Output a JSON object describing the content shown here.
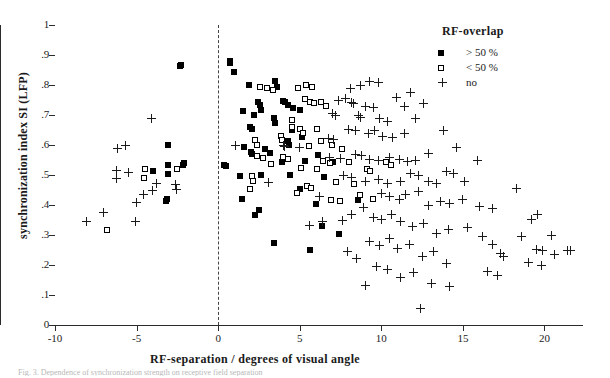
{
  "figure": {
    "caption_partial": "Fig. 3. Dependence of synchronization strength on receptive field separation"
  },
  "legend": {
    "title": "RF-overlap",
    "entries": [
      {
        "key": "filled-square",
        "label": "> 50 %"
      },
      {
        "key": "open-square",
        "label": "< 50 %"
      },
      {
        "key": "plus",
        "label": "no"
      }
    ]
  },
  "chart_data": {
    "type": "scatter",
    "title": "",
    "xlabel": "RF-separation / degrees of visual angle",
    "ylabel": "synchronization index SI (LFP)",
    "xlim": [
      -10,
      22.3
    ],
    "ylim": [
      0,
      1
    ],
    "xticks": [
      -10,
      -5,
      0,
      5,
      10,
      15,
      20
    ],
    "xticklabels": [
      "-10",
      "-5",
      "0",
      "5",
      "10",
      "15",
      "20"
    ],
    "yticks": [
      0,
      0.1,
      0.2,
      0.3,
      0.4,
      0.5,
      0.6,
      0.7,
      0.8,
      0.9,
      1
    ],
    "yticklabels": [
      "0",
      ".1",
      ".2",
      ".3",
      ".4",
      ".5",
      ".6",
      ".7",
      ".8",
      ".9",
      "1"
    ],
    "grid": false,
    "legend_position": "top-right",
    "reference_lines": [
      {
        "orientation": "vertical",
        "value": 0,
        "style": "dashed"
      }
    ],
    "series": [
      {
        "name": "> 50 %",
        "marker": "filled-square",
        "points": [
          [
            -2.3,
            0.868
          ],
          [
            -2.35,
            0.862
          ],
          [
            -3.1,
            0.6
          ],
          [
            -3.1,
            0.535
          ],
          [
            -3.1,
            0.505
          ],
          [
            -2.1,
            0.54
          ],
          [
            -4.0,
            0.515
          ],
          [
            -3.15,
            0.42
          ],
          [
            -3.2,
            0.412
          ],
          [
            -2.15,
            0.535
          ],
          [
            0.35,
            0.535
          ],
          [
            0.45,
            0.53
          ],
          [
            0.7,
            0.88
          ],
          [
            0.75,
            0.872
          ],
          [
            0.95,
            0.845
          ],
          [
            1.9,
            0.8
          ],
          [
            3.5,
            0.812
          ],
          [
            3.6,
            0.795
          ],
          [
            1.5,
            0.712
          ],
          [
            2.2,
            0.7
          ],
          [
            2.6,
            0.718
          ],
          [
            1.95,
            0.66
          ],
          [
            2.05,
            0.655
          ],
          [
            4.0,
            0.748
          ],
          [
            4.1,
            0.742
          ],
          [
            4.3,
            0.735
          ],
          [
            4.6,
            0.722
          ],
          [
            5.0,
            0.718
          ],
          [
            3.45,
            0.69
          ],
          [
            3.5,
            0.672
          ],
          [
            1.6,
            0.595
          ],
          [
            2.0,
            0.578
          ],
          [
            2.05,
            0.57
          ],
          [
            2.9,
            0.588
          ],
          [
            3.2,
            0.575
          ],
          [
            4.3,
            0.612
          ],
          [
            4.35,
            0.6
          ],
          [
            1.35,
            0.498
          ],
          [
            2.6,
            0.5
          ],
          [
            1.45,
            0.42
          ],
          [
            2.25,
            0.368
          ],
          [
            2.5,
            0.382
          ],
          [
            3.4,
            0.275
          ],
          [
            5.3,
            0.548
          ],
          [
            6.5,
            0.492
          ],
          [
            4.55,
            0.65
          ],
          [
            5.15,
            0.628
          ],
          [
            6.0,
            0.405
          ],
          [
            6.35,
            0.33
          ],
          [
            5.0,
            0.452
          ],
          [
            5.6,
            0.25
          ],
          [
            7.4,
            0.305
          ],
          [
            8.6,
            0.418
          ],
          [
            7.05,
            0.545
          ],
          [
            6.1,
            0.568
          ],
          [
            3.9,
            0.545
          ],
          [
            4.4,
            0.5
          ],
          [
            2.45,
            0.742
          ],
          [
            2.55,
            0.735
          ]
        ]
      },
      {
        "name": "< 50 %",
        "marker": "open-square",
        "points": [
          [
            -6.8,
            0.318
          ],
          [
            -4.5,
            0.52
          ],
          [
            -4.55,
            0.49
          ],
          [
            -2.55,
            0.52
          ],
          [
            2.55,
            0.795
          ],
          [
            3.0,
            0.79
          ],
          [
            3.35,
            0.785
          ],
          [
            4.9,
            0.79
          ],
          [
            5.4,
            0.8
          ],
          [
            5.75,
            0.795
          ],
          [
            5.3,
            0.752
          ],
          [
            5.6,
            0.745
          ],
          [
            5.9,
            0.74
          ],
          [
            6.3,
            0.742
          ],
          [
            6.6,
            0.73
          ],
          [
            4.5,
            0.682
          ],
          [
            4.55,
            0.66
          ],
          [
            3.85,
            0.63
          ],
          [
            3.9,
            0.618
          ],
          [
            5.0,
            0.655
          ],
          [
            5.2,
            0.64
          ],
          [
            6.05,
            0.655
          ],
          [
            3.95,
            0.56
          ],
          [
            4.25,
            0.555
          ],
          [
            5.55,
            0.598
          ],
          [
            6.3,
            0.612
          ],
          [
            7.0,
            0.6
          ],
          [
            7.6,
            0.588
          ],
          [
            5.05,
            0.522
          ],
          [
            6.05,
            0.52
          ],
          [
            6.4,
            0.548
          ],
          [
            6.85,
            0.54
          ],
          [
            2.25,
            0.618
          ],
          [
            2.35,
            0.6
          ],
          [
            2.4,
            0.565
          ],
          [
            2.75,
            0.558
          ],
          [
            3.25,
            0.538
          ],
          [
            7.2,
            0.478
          ],
          [
            8.35,
            0.47
          ],
          [
            9.1,
            0.52
          ],
          [
            9.3,
            0.512
          ],
          [
            8.0,
            0.545
          ],
          [
            5.45,
            0.465
          ],
          [
            5.7,
            0.458
          ],
          [
            4.85,
            0.44
          ],
          [
            10.3,
            0.545
          ],
          [
            10.6,
            0.535
          ],
          [
            2.05,
            0.498
          ],
          [
            2.15,
            0.48
          ],
          [
            1.95,
            0.452
          ],
          [
            8.7,
            0.435
          ],
          [
            9.5,
            0.42
          ],
          [
            6.9,
            0.418
          ],
          [
            7.45,
            0.412
          ]
        ]
      },
      {
        "name": "no",
        "marker": "plus",
        "points": [
          [
            -8.1,
            0.345
          ],
          [
            -7.0,
            0.375
          ],
          [
            -6.2,
            0.59
          ],
          [
            -5.7,
            0.598
          ],
          [
            -6.25,
            0.515
          ],
          [
            -6.25,
            0.49
          ],
          [
            -5.5,
            0.51
          ],
          [
            -5.0,
            0.408
          ],
          [
            -5.05,
            0.345
          ],
          [
            -4.55,
            0.435
          ],
          [
            -4.1,
            0.69
          ],
          [
            -4.0,
            0.45
          ],
          [
            -3.8,
            0.472
          ],
          [
            4.0,
            0.6
          ],
          [
            4.05,
            0.595
          ],
          [
            5.0,
            0.592
          ],
          [
            6.75,
            0.622
          ],
          [
            7.05,
            0.618
          ],
          [
            7.4,
            0.748
          ],
          [
            7.8,
            0.755
          ],
          [
            8.1,
            0.79
          ],
          [
            8.7,
            0.8
          ],
          [
            9.3,
            0.812
          ],
          [
            9.8,
            0.81
          ],
          [
            8.15,
            0.742
          ],
          [
            8.3,
            0.738
          ],
          [
            9.05,
            0.73
          ],
          [
            9.5,
            0.725
          ],
          [
            8.6,
            0.7
          ],
          [
            8.75,
            0.692
          ],
          [
            7.0,
            0.705
          ],
          [
            7.2,
            0.698
          ],
          [
            9.9,
            0.688
          ],
          [
            10.4,
            0.68
          ],
          [
            8.0,
            0.652
          ],
          [
            8.4,
            0.648
          ],
          [
            9.2,
            0.64
          ],
          [
            9.6,
            0.648
          ],
          [
            10.1,
            0.63
          ],
          [
            10.7,
            0.625
          ],
          [
            11.4,
            0.64
          ],
          [
            6.8,
            0.56
          ],
          [
            7.5,
            0.555
          ],
          [
            8.4,
            0.57
          ],
          [
            8.8,
            0.565
          ],
          [
            9.25,
            0.552
          ],
          [
            9.8,
            0.548
          ],
          [
            10.5,
            0.56
          ],
          [
            11.1,
            0.552
          ],
          [
            11.6,
            0.545
          ],
          [
            12.1,
            0.548
          ],
          [
            7.7,
            0.498
          ],
          [
            8.2,
            0.492
          ],
          [
            9.0,
            0.478
          ],
          [
            9.8,
            0.485
          ],
          [
            10.4,
            0.472
          ],
          [
            11.2,
            0.48
          ],
          [
            11.8,
            0.505
          ],
          [
            12.3,
            0.498
          ],
          [
            12.9,
            0.48
          ],
          [
            13.4,
            0.472
          ],
          [
            14.0,
            0.512
          ],
          [
            14.4,
            0.505
          ],
          [
            15.1,
            0.48
          ],
          [
            10.0,
            0.44
          ],
          [
            10.5,
            0.428
          ],
          [
            11.1,
            0.42
          ],
          [
            11.5,
            0.435
          ],
          [
            12.3,
            0.445
          ],
          [
            12.9,
            0.4
          ],
          [
            13.6,
            0.412
          ],
          [
            14.2,
            0.405
          ],
          [
            15.0,
            0.418
          ],
          [
            9.5,
            0.36
          ],
          [
            10.0,
            0.352
          ],
          [
            10.6,
            0.37
          ],
          [
            11.2,
            0.345
          ],
          [
            11.9,
            0.33
          ],
          [
            12.6,
            0.34
          ],
          [
            13.4,
            0.305
          ],
          [
            14.1,
            0.318
          ],
          [
            15.3,
            0.325
          ],
          [
            9.3,
            0.28
          ],
          [
            9.9,
            0.265
          ],
          [
            10.5,
            0.29
          ],
          [
            11.0,
            0.255
          ],
          [
            11.7,
            0.268
          ],
          [
            12.5,
            0.23
          ],
          [
            13.2,
            0.245
          ],
          [
            14.0,
            0.205
          ],
          [
            9.7,
            0.195
          ],
          [
            10.4,
            0.185
          ],
          [
            11.2,
            0.16
          ],
          [
            12.0,
            0.175
          ],
          [
            13.1,
            0.14
          ],
          [
            14.2,
            0.13
          ],
          [
            12.4,
            0.055
          ],
          [
            16.2,
            0.295
          ],
          [
            16.8,
            0.268
          ],
          [
            17.3,
            0.24
          ],
          [
            17.5,
            0.23
          ],
          [
            16.5,
            0.18
          ],
          [
            17.1,
            0.165
          ],
          [
            18.3,
            0.455
          ],
          [
            19.2,
            0.352
          ],
          [
            19.6,
            0.368
          ],
          [
            18.6,
            0.295
          ],
          [
            20.4,
            0.3
          ],
          [
            19.5,
            0.252
          ],
          [
            19.9,
            0.248
          ],
          [
            20.6,
            0.235
          ],
          [
            21.4,
            0.25
          ],
          [
            21.6,
            0.248
          ],
          [
            19.0,
            0.21
          ],
          [
            19.8,
            0.2
          ],
          [
            16.0,
            0.395
          ],
          [
            16.8,
            0.388
          ],
          [
            5.6,
            0.332
          ],
          [
            6.4,
            0.345
          ],
          [
            6.2,
            0.43
          ],
          [
            -2.6,
            0.468
          ],
          [
            -2.55,
            0.452
          ],
          [
            1.05,
            0.6
          ],
          [
            3.1,
            0.475
          ],
          [
            7.6,
            0.35
          ],
          [
            8.2,
            0.368
          ],
          [
            8.9,
            0.392
          ],
          [
            7.9,
            0.245
          ],
          [
            8.5,
            0.222
          ],
          [
            9.0,
            0.132
          ],
          [
            13.8,
            0.65
          ],
          [
            14.6,
            0.592
          ],
          [
            15.9,
            0.548
          ],
          [
            12.9,
            0.572
          ],
          [
            12.1,
            0.69
          ],
          [
            11.4,
            0.728
          ],
          [
            10.9,
            0.76
          ],
          [
            11.8,
            0.775
          ],
          [
            12.6,
            0.74
          ]
        ]
      }
    ]
  }
}
